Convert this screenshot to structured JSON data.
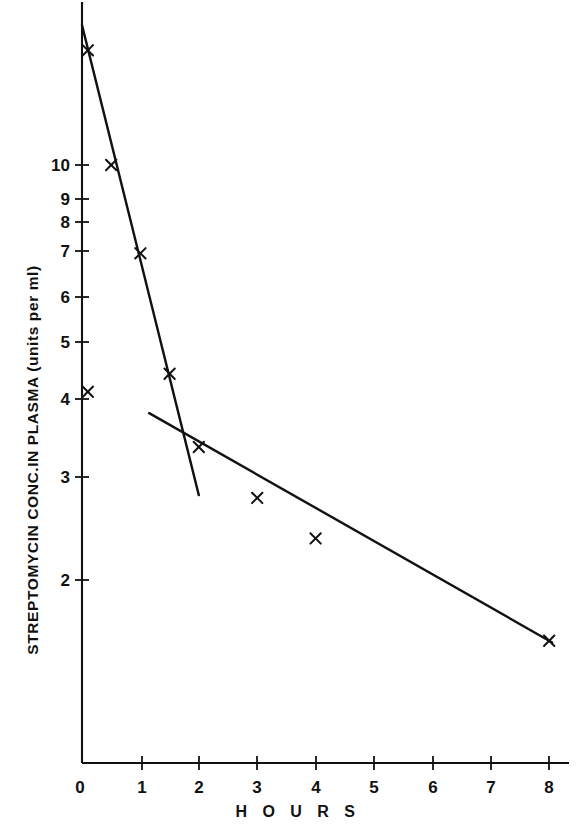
{
  "chart_data": {
    "type": "line",
    "title": "",
    "subtitle": "",
    "xlabel": "H O U R S",
    "ylabel": "STREPTOMYCIN CONC.IN PLASMA (units per ml)",
    "yscale": "log",
    "xscale": "linear",
    "xlim": [
      0,
      8.3
    ],
    "ylim": [
      1.55,
      17.5
    ],
    "grid": false,
    "legend": "none",
    "xticks": [
      0,
      1,
      2,
      3,
      4,
      5,
      6,
      7,
      8
    ],
    "xticklabels": [
      "0",
      "1",
      "2",
      "3",
      "4",
      "5",
      "6",
      "7",
      "8"
    ],
    "yticks": [
      2,
      3,
      4,
      5,
      6,
      7,
      8,
      9,
      10
    ],
    "yticklabels": [
      "2",
      "3",
      "4",
      "5",
      "6",
      "7",
      "8",
      "9",
      "10"
    ],
    "marker": "x",
    "series": [
      {
        "name": "fast phase",
        "marker": "x",
        "linestyle": "solid",
        "points": [
          {
            "x": 0.1,
            "y": 15.6
          },
          {
            "x": 0.5,
            "y": 10.0
          },
          {
            "x": 1.0,
            "y": 7.1
          },
          {
            "x": 1.5,
            "y": 4.45
          }
        ],
        "fit_line": {
          "x0": 0.0,
          "y0": 17.2,
          "x1": 2.0,
          "y1": 2.78
        }
      },
      {
        "name": "slow phase",
        "marker": "x",
        "linestyle": "solid",
        "points": [
          {
            "x": 0.1,
            "y": 4.15
          },
          {
            "x": 2.0,
            "y": 3.35
          },
          {
            "x": 3.0,
            "y": 2.75
          },
          {
            "x": 4.0,
            "y": 2.35
          },
          {
            "x": 8.0,
            "y": 1.58
          }
        ],
        "fit_line": {
          "x0": 1.15,
          "y0": 3.82,
          "x1": 8.05,
          "y1": 1.57
        }
      }
    ]
  },
  "axes": {
    "x_title": "H O U R S",
    "y_title": "STREPTOMYCIN CONC.IN PLASMA (units per ml)",
    "x_tick_labels": [
      "0",
      "1",
      "2",
      "3",
      "4",
      "5",
      "6",
      "7",
      "8"
    ],
    "y_tick_labels": [
      "2",
      "3",
      "4",
      "5",
      "6",
      "7",
      "8",
      "9",
      "10"
    ]
  },
  "colors": {
    "ink": "#111111",
    "background": "#ffffff",
    "line": "#111111"
  }
}
